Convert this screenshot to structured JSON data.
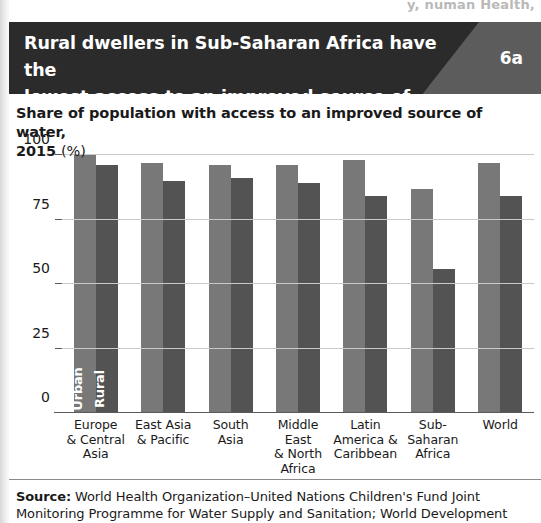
{
  "page": {
    "cut_off_header_text": "y, numan Health,"
  },
  "header": {
    "title_line1": "Rural dwellers in Sub-Saharan Africa have the",
    "title_line2": "lowest access to an improved source of water",
    "figure_number": "6a",
    "title_bg_color": "#2b2b2b",
    "badge_bg_color": "#5c5c5c"
  },
  "subtitle": {
    "text": "Share of population with access to an improved source of water,",
    "year_line": "2015 ",
    "unit": "(%)"
  },
  "source": {
    "label": "Source:",
    "line1": " World Health Organization–United Nations Children's Fund Joint",
    "line2": "Monitoring Programme for Water Supply and Sanitation; World Development"
  },
  "legend": {
    "urban": "Urban",
    "rural": "Rural",
    "urban_color": "#787878",
    "rural_color": "#535353"
  },
  "chart_data": {
    "type": "bar",
    "title": "Share of population with access to an improved source of water, 2015 (%)",
    "xlabel": "",
    "ylabel": "",
    "ylim": [
      0,
      100
    ],
    "yticks": [
      0,
      25,
      50,
      75,
      100
    ],
    "ytick_labels": [
      "0",
      "25",
      "50",
      "75",
      "100"
    ],
    "grid": true,
    "legend_position": "inside-first-bars",
    "categories": [
      "Europe & Central Asia",
      "East Asia & Pacific",
      "South Asia",
      "Middle East & North Africa",
      "Latin America & Caribbean",
      "Sub-Saharan Africa",
      "World"
    ],
    "category_lines": [
      [
        "Europe",
        "& Central",
        "Asia"
      ],
      [
        "East Asia",
        "& Pacific"
      ],
      [
        "South",
        "Asia"
      ],
      [
        "Middle East",
        "& North",
        "Africa"
      ],
      [
        "Latin",
        "America &",
        "Caribbean"
      ],
      [
        "Sub-Saharan",
        "Africa"
      ],
      [
        "World"
      ]
    ],
    "series": [
      {
        "name": "Urban",
        "color": "#787878",
        "values": [
          100,
          97,
          96,
          96,
          98,
          87,
          97
        ]
      },
      {
        "name": "Rural",
        "color": "#535353",
        "values": [
          96,
          90,
          91,
          89,
          84,
          56,
          84
        ]
      }
    ]
  }
}
